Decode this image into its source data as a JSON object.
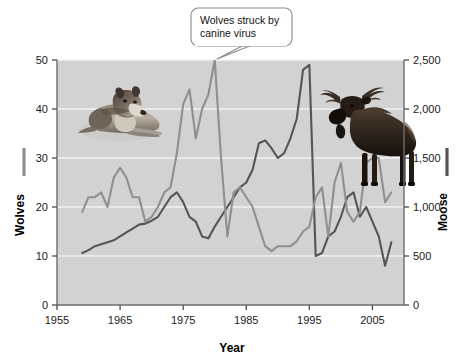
{
  "chart_data": {
    "type": "line",
    "title": "",
    "xlabel": "Year",
    "plot_bg": "#d2d2d2",
    "grid": true,
    "grid_color": "#f2f2f2",
    "xlim": [
      1955,
      2010
    ],
    "xticks": [
      1955,
      1965,
      1975,
      1985,
      1995,
      2005
    ],
    "xtick_labels": [
      "1955",
      "1965",
      "1975",
      "1985",
      "1995",
      "2005"
    ],
    "axes": [
      {
        "id": "left",
        "label": "Wolves",
        "color": "#8f8f8f",
        "ylim": [
          0,
          50
        ],
        "yticks": [
          0,
          10,
          20,
          30,
          40,
          50
        ],
        "ytick_labels": [
          "0",
          "10",
          "20",
          "30",
          "40",
          "50"
        ]
      },
      {
        "id": "right",
        "label": "Moose",
        "color": "#555555",
        "ylim": [
          0,
          2500
        ],
        "yticks": [
          0,
          500,
          1000,
          1500,
          2000,
          2500
        ],
        "ytick_labels": [
          "0",
          "500",
          "1,000",
          "1,500",
          "2,000",
          "2,500"
        ]
      }
    ],
    "series": [
      {
        "name": "Wolves",
        "axis": "left",
        "color": "#8f8f8f",
        "x": [
          1959,
          1960,
          1961,
          1962,
          1963,
          1964,
          1965,
          1966,
          1967,
          1968,
          1969,
          1970,
          1971,
          1972,
          1973,
          1974,
          1975,
          1976,
          1977,
          1978,
          1979,
          1980,
          1981,
          1982,
          1983,
          1984,
          1985,
          1986,
          1987,
          1988,
          1989,
          1990,
          1991,
          1992,
          1993,
          1994,
          1995,
          1996,
          1997,
          1998,
          1999,
          2000,
          2001,
          2002,
          2003,
          2004,
          2005,
          2006,
          2007,
          2008
        ],
        "values": [
          19,
          22,
          22,
          23,
          20,
          26,
          28,
          26,
          22,
          22,
          17,
          18,
          20,
          23,
          24,
          31,
          41,
          44,
          34,
          40,
          43,
          50,
          30,
          14,
          23,
          24,
          22,
          20,
          16,
          12,
          11,
          12,
          12,
          12,
          13,
          15,
          16,
          22,
          24,
          14,
          25,
          29,
          19,
          17,
          19,
          29,
          30,
          30,
          21,
          23
        ]
      },
      {
        "name": "Moose",
        "axis": "right",
        "color": "#555555",
        "x": [
          1959,
          1960,
          1961,
          1962,
          1963,
          1964,
          1965,
          1966,
          1967,
          1968,
          1969,
          1970,
          1971,
          1972,
          1973,
          1974,
          1975,
          1976,
          1977,
          1978,
          1979,
          1980,
          1981,
          1982,
          1983,
          1984,
          1985,
          1986,
          1987,
          1988,
          1989,
          1990,
          1991,
          1992,
          1993,
          1994,
          1995,
          1996,
          1997,
          1998,
          1999,
          2000,
          2001,
          2002,
          2003,
          2004,
          2005,
          2006,
          2007,
          2008
        ],
        "values": [
          530,
          560,
          600,
          620,
          640,
          660,
          700,
          740,
          780,
          820,
          830,
          860,
          900,
          1000,
          1100,
          1150,
          1050,
          900,
          850,
          700,
          680,
          800,
          900,
          1000,
          1100,
          1200,
          1250,
          1380,
          1650,
          1680,
          1600,
          1500,
          1550,
          1700,
          1900,
          2400,
          2450,
          500,
          530,
          700,
          750,
          900,
          1100,
          1150,
          900,
          1000,
          850,
          700,
          400,
          640
        ]
      }
    ],
    "annotations": [
      {
        "id": "canine-virus-callout",
        "text_line1": "Wolves struck by",
        "text_line2": "canine virus",
        "points_to_year": 1981,
        "points_to_value": 48
      }
    ],
    "images": [
      {
        "id": "wolf-photo",
        "alt": "Resting gray wolf"
      },
      {
        "id": "moose-photo",
        "alt": "Standing bull moose"
      }
    ]
  }
}
